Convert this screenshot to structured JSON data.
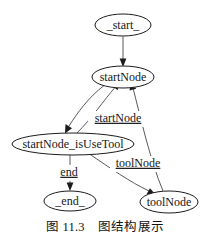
{
  "figure": {
    "caption": "图 11.3    图结构展示",
    "caption_number": "图 11.3",
    "caption_title": "图结构展示",
    "background_color": "#ffffff",
    "node_stroke_color": "#1c1c1c",
    "edge_stroke_color": "#5a5a5a",
    "text_color": "#161616"
  },
  "graph": {
    "type": "directed-graph",
    "nodes": [
      {
        "id": "start",
        "label": "_start_",
        "cx": 123,
        "cy": 25,
        "rx": 28,
        "ry": 11,
        "font_size": 12
      },
      {
        "id": "startNode",
        "label": "startNode",
        "cx": 123,
        "cy": 77,
        "rx": 31,
        "ry": 11,
        "font_size": 12
      },
      {
        "id": "startNode_isUseTool",
        "label": "startNode_isUseTool",
        "cx": 73,
        "cy": 144,
        "rx": 61,
        "ry": 11,
        "font_size": 12
      },
      {
        "id": "end",
        "label": "_end_",
        "cx": 70,
        "cy": 201,
        "rx": 26,
        "ry": 10,
        "font_size": 12
      },
      {
        "id": "toolNode",
        "label": "toolNode",
        "cx": 169,
        "cy": 202,
        "rx": 29,
        "ry": 11,
        "font_size": 12
      }
    ],
    "edges": [
      {
        "from": "start",
        "to": "startNode",
        "label": ""
      },
      {
        "from": "startNode",
        "to": "startNode_isUseTool",
        "label": ""
      },
      {
        "from": "startNode_isUseTool",
        "to": "startNode",
        "label": "startNode"
      },
      {
        "from": "startNode_isUseTool",
        "to": "end",
        "label": "end"
      },
      {
        "from": "startNode_isUseTool",
        "to": "toolNode",
        "label": "toolNode"
      },
      {
        "from": "toolNode",
        "to": "startNode",
        "label": ""
      }
    ],
    "edge_labels": [
      {
        "id": "label-startNode",
        "text": "startNode",
        "x": 118,
        "y": 119,
        "font_size": 12
      },
      {
        "id": "label-toolNode",
        "text": "toolNode",
        "x": 138,
        "y": 164,
        "font_size": 12
      },
      {
        "id": "label-end",
        "text": "end",
        "x": 69,
        "y": 173,
        "font_size": 12
      }
    ]
  }
}
